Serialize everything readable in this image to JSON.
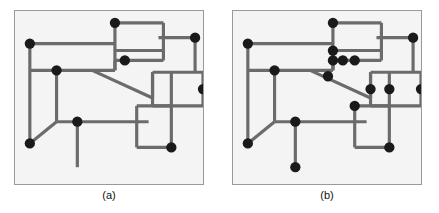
{
  "figure": {
    "title": "",
    "background_color": "#ffffff",
    "panel_background_color": "#f4f4f4",
    "panel_border_color": "#9a9a9a",
    "edge_color": "#6b6b6b",
    "vertex_color": "#1a1a1a",
    "edge_width": 3.2,
    "vertex_radius": 5.2,
    "panel_width": 190,
    "panel_height": 175,
    "view_box": "0 0 190 175"
  },
  "panels": [
    {
      "id": "a",
      "caption": "(a)",
      "description": "Orthogonal line drawing with a partial set of marked junction vertices",
      "edges": [
        {
          "x1": 15,
          "y1": 33,
          "x2": 101,
          "y2": 33
        },
        {
          "x1": 15,
          "y1": 33,
          "x2": 15,
          "y2": 134
        },
        {
          "x1": 15,
          "y1": 134,
          "x2": 42,
          "y2": 112
        },
        {
          "x1": 42,
          "y1": 112,
          "x2": 42,
          "y2": 60
        },
        {
          "x1": 15,
          "y1": 60,
          "x2": 101,
          "y2": 60
        },
        {
          "x1": 42,
          "y1": 112,
          "x2": 135,
          "y2": 112
        },
        {
          "x1": 63,
          "y1": 112,
          "x2": 63,
          "y2": 158
        },
        {
          "x1": 101,
          "y1": 12,
          "x2": 101,
          "y2": 60
        },
        {
          "x1": 101,
          "y1": 12,
          "x2": 150,
          "y2": 12
        },
        {
          "x1": 150,
          "y1": 12,
          "x2": 150,
          "y2": 50
        },
        {
          "x1": 101,
          "y1": 40,
          "x2": 150,
          "y2": 40
        },
        {
          "x1": 145,
          "y1": 27,
          "x2": 182,
          "y2": 27
        },
        {
          "x1": 182,
          "y1": 27,
          "x2": 182,
          "y2": 62
        },
        {
          "x1": 101,
          "y1": 50,
          "x2": 150,
          "y2": 50
        },
        {
          "x1": 101,
          "y1": 50,
          "x2": 101,
          "y2": 60
        },
        {
          "x1": 78,
          "y1": 60,
          "x2": 139,
          "y2": 88
        },
        {
          "x1": 139,
          "y1": 88,
          "x2": 139,
          "y2": 62
        },
        {
          "x1": 139,
          "y1": 62,
          "x2": 190,
          "y2": 62
        },
        {
          "x1": 139,
          "y1": 62,
          "x2": 139,
          "y2": 96
        },
        {
          "x1": 158,
          "y1": 62,
          "x2": 158,
          "y2": 96
        },
        {
          "x1": 139,
          "y1": 96,
          "x2": 190,
          "y2": 96
        },
        {
          "x1": 190,
          "y1": 62,
          "x2": 190,
          "y2": 96
        },
        {
          "x1": 123,
          "y1": 96,
          "x2": 123,
          "y2": 138
        },
        {
          "x1": 123,
          "y1": 96,
          "x2": 158,
          "y2": 96
        },
        {
          "x1": 158,
          "y1": 96,
          "x2": 158,
          "y2": 138
        },
        {
          "x1": 123,
          "y1": 138,
          "x2": 158,
          "y2": 138
        }
      ],
      "vertices": [
        {
          "x": 15,
          "y": 33
        },
        {
          "x": 15,
          "y": 134
        },
        {
          "x": 42,
          "y": 60
        },
        {
          "x": 63,
          "y": 112
        },
        {
          "x": 101,
          "y": 12
        },
        {
          "x": 111,
          "y": 50
        },
        {
          "x": 182,
          "y": 27
        },
        {
          "x": 190,
          "y": 79
        },
        {
          "x": 158,
          "y": 138
        }
      ]
    },
    {
      "id": "b",
      "caption": "(b)",
      "description": "Same orthogonal line drawing with the complete set of marked junction vertices",
      "edges": [
        {
          "x1": 15,
          "y1": 33,
          "x2": 101,
          "y2": 33
        },
        {
          "x1": 15,
          "y1": 33,
          "x2": 15,
          "y2": 134
        },
        {
          "x1": 15,
          "y1": 134,
          "x2": 42,
          "y2": 112
        },
        {
          "x1": 42,
          "y1": 112,
          "x2": 42,
          "y2": 60
        },
        {
          "x1": 15,
          "y1": 60,
          "x2": 101,
          "y2": 60
        },
        {
          "x1": 42,
          "y1": 112,
          "x2": 135,
          "y2": 112
        },
        {
          "x1": 63,
          "y1": 112,
          "x2": 63,
          "y2": 158
        },
        {
          "x1": 101,
          "y1": 12,
          "x2": 101,
          "y2": 60
        },
        {
          "x1": 101,
          "y1": 12,
          "x2": 150,
          "y2": 12
        },
        {
          "x1": 150,
          "y1": 12,
          "x2": 150,
          "y2": 50
        },
        {
          "x1": 101,
          "y1": 40,
          "x2": 150,
          "y2": 40
        },
        {
          "x1": 145,
          "y1": 27,
          "x2": 182,
          "y2": 27
        },
        {
          "x1": 182,
          "y1": 27,
          "x2": 182,
          "y2": 62
        },
        {
          "x1": 101,
          "y1": 50,
          "x2": 150,
          "y2": 50
        },
        {
          "x1": 101,
          "y1": 50,
          "x2": 101,
          "y2": 60
        },
        {
          "x1": 78,
          "y1": 60,
          "x2": 139,
          "y2": 88
        },
        {
          "x1": 139,
          "y1": 88,
          "x2": 139,
          "y2": 62
        },
        {
          "x1": 139,
          "y1": 62,
          "x2": 190,
          "y2": 62
        },
        {
          "x1": 139,
          "y1": 62,
          "x2": 139,
          "y2": 96
        },
        {
          "x1": 158,
          "y1": 62,
          "x2": 158,
          "y2": 96
        },
        {
          "x1": 139,
          "y1": 96,
          "x2": 190,
          "y2": 96
        },
        {
          "x1": 190,
          "y1": 62,
          "x2": 190,
          "y2": 96
        },
        {
          "x1": 123,
          "y1": 96,
          "x2": 123,
          "y2": 138
        },
        {
          "x1": 123,
          "y1": 96,
          "x2": 158,
          "y2": 96
        },
        {
          "x1": 158,
          "y1": 96,
          "x2": 158,
          "y2": 138
        },
        {
          "x1": 123,
          "y1": 138,
          "x2": 158,
          "y2": 138
        }
      ],
      "vertices": [
        {
          "x": 15,
          "y": 33
        },
        {
          "x": 15,
          "y": 134
        },
        {
          "x": 42,
          "y": 60
        },
        {
          "x": 63,
          "y": 112
        },
        {
          "x": 63,
          "y": 158
        },
        {
          "x": 101,
          "y": 12
        },
        {
          "x": 101,
          "y": 40
        },
        {
          "x": 101,
          "y": 50
        },
        {
          "x": 111,
          "y": 50
        },
        {
          "x": 123,
          "y": 50
        },
        {
          "x": 96,
          "y": 66
        },
        {
          "x": 139,
          "y": 79
        },
        {
          "x": 158,
          "y": 79
        },
        {
          "x": 190,
          "y": 79
        },
        {
          "x": 182,
          "y": 27
        },
        {
          "x": 123,
          "y": 96
        },
        {
          "x": 158,
          "y": 138
        }
      ]
    }
  ]
}
